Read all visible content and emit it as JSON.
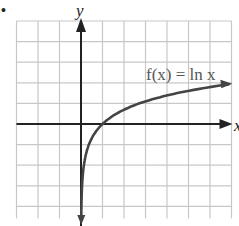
{
  "bullet": "•",
  "chart_data": {
    "type": "line",
    "title": "",
    "function_label": "f(x) = ln x",
    "xlabel": "x",
    "ylabel": "y",
    "xlim": [
      -3,
      7
    ],
    "ylim": [
      -4,
      5
    ],
    "grid": true,
    "grid_step": 1,
    "asymptote": "x = 0 (vertical)",
    "x_intercept": [
      1,
      0
    ],
    "series": [
      {
        "name": "f(x) = ln x",
        "x": [
          0.02,
          0.05,
          0.1,
          0.2,
          0.3,
          0.5,
          0.75,
          1,
          1.5,
          2,
          3,
          4,
          5,
          6,
          6.9
        ],
        "y": [
          -3.91,
          -3.0,
          -2.3,
          -1.61,
          -1.2,
          -0.69,
          -0.29,
          0,
          0.41,
          0.69,
          1.1,
          1.39,
          1.61,
          1.79,
          1.93
        ]
      }
    ]
  },
  "colors": {
    "grid": "#c8c8c8",
    "axis": "#222222",
    "curve": "#444444",
    "label": "#555555"
  }
}
